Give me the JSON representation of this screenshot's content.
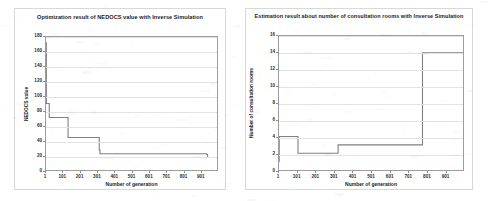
{
  "document": {
    "background_color": "#ffffff",
    "figure_count": 2
  },
  "chart_data": [
    {
      "id": "nedocs-optimization",
      "type": "line",
      "title": "Optimization result of NEDOCS value with Inverse Simulation",
      "xlabel": "Number of generation",
      "ylabel": "NEDOCS value",
      "xlim": [
        1,
        1000
      ],
      "ylim": [
        0,
        180
      ],
      "xticks": [
        1,
        101,
        201,
        301,
        401,
        501,
        601,
        701,
        801,
        901
      ],
      "xtick_labels": [
        "1",
        "101",
        "201",
        "301",
        "401",
        "501",
        "601",
        "701",
        "801",
        "901"
      ],
      "yticks": [
        0,
        20,
        40,
        60,
        80,
        100,
        120,
        140,
        160,
        180
      ],
      "ytick_labels": [
        "0",
        "20",
        "40",
        "60",
        "80",
        "100",
        "120",
        "140",
        "160",
        "180"
      ],
      "grid": "horizontal",
      "legend": "none",
      "series": [
        {
          "name": "NEDOCS value",
          "color": "#808080",
          "style": "step",
          "x": [
            1,
            3,
            6,
            18,
            20,
            95,
            98,
            130,
            133,
            312,
            316,
            795,
            940,
            945,
            1000
          ],
          "y": [
            172,
            90,
            90,
            90,
            71,
            71,
            71,
            44,
            44,
            27,
            22,
            22,
            21,
            17,
            17
          ]
        }
      ]
    },
    {
      "id": "consultation-rooms-estimation",
      "type": "line",
      "title": "Estimation result about number of consultation rooms with Inverse Simulation",
      "xlabel": "Number of generation",
      "ylabel": "Number of consultation rooms",
      "xlim": [
        1,
        1000
      ],
      "ylim": [
        0,
        16
      ],
      "xticks": [
        1,
        101,
        201,
        301,
        401,
        501,
        601,
        701,
        801,
        901
      ],
      "xtick_labels": [
        "1",
        "101",
        "201",
        "301",
        "401",
        "501",
        "601",
        "701",
        "801",
        "901"
      ],
      "yticks": [
        0,
        2,
        4,
        6,
        8,
        10,
        12,
        14,
        16
      ],
      "ytick_labels": [
        "0",
        "2",
        "4",
        "6",
        "8",
        "10",
        "12",
        "14",
        "16"
      ],
      "grid": "horizontal",
      "legend": "none",
      "series": [
        {
          "name": "Number of consultation rooms",
          "color": "#808080",
          "style": "step",
          "x": [
            1,
            2,
            100,
            104,
            318,
            322,
            775,
            780,
            1000
          ],
          "y": [
            1,
            4,
            4,
            2,
            2,
            3,
            3,
            14,
            14
          ]
        }
      ]
    }
  ]
}
